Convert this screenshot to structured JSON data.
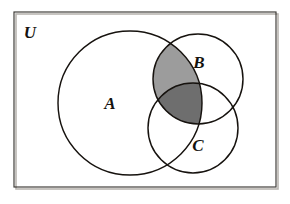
{
  "figure": {
    "type": "venn-diagram",
    "background_color": "#ffffff",
    "stroke_color": "#16120e",
    "frame_color": "#3a3733",
    "frame_shadow_color": "#b9b6b1"
  },
  "universe": {
    "label": "U",
    "label_x": 30,
    "label_y": 38,
    "rect": {
      "x": 14,
      "y": 12,
      "width": 262,
      "height": 175
    }
  },
  "sets": [
    {
      "id": "A",
      "label": "A",
      "cx": 130,
      "cy": 103,
      "r": 72,
      "label_x": 110,
      "label_y": 109
    },
    {
      "id": "B",
      "label": "B",
      "cx": 198,
      "cy": 79,
      "r": 45,
      "label_x": 199,
      "label_y": 68
    },
    {
      "id": "C",
      "label": "C",
      "cx": 193,
      "cy": 128,
      "r": 45,
      "label_x": 198,
      "label_y": 151
    }
  ],
  "shaded_regions": [
    {
      "id": "A-and-B-only",
      "name": "A intersect B minus C",
      "fill": "#9c9c9c",
      "expression": "A ∩ B ∩ C'"
    },
    {
      "id": "A-and-B-and-C",
      "name": "A intersect B intersect C",
      "fill": "#6e6e6e",
      "expression": "A ∩ B ∩ C"
    }
  ],
  "shaded_expression": "A ∩ B"
}
